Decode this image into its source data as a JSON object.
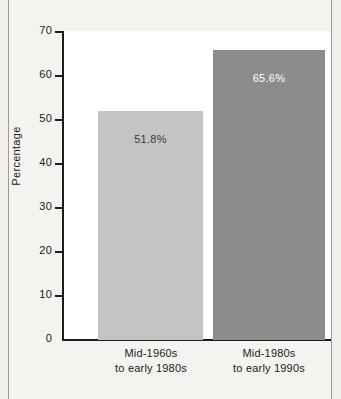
{
  "chart_data": {
    "type": "bar",
    "title": "",
    "subtitle": "",
    "xlabel": "",
    "ylabel": "Percentage",
    "categories": [
      "Mid-1960s to early 1980s",
      "Mid-1980s to early 1990s"
    ],
    "category_lines": [
      [
        "Mid-1960s",
        "to early 1980s"
      ],
      [
        "Mid-1980s",
        "to early 1990s"
      ]
    ],
    "values": [
      51.8,
      65.6
    ],
    "data_labels": [
      "51.8%",
      "65.6%"
    ],
    "ylim": [
      0,
      70
    ],
    "ytick_values": [
      0,
      10,
      20,
      30,
      40,
      50,
      60,
      70
    ],
    "ytick_labels": [
      "0",
      "10",
      "20",
      "30",
      "40",
      "50",
      "60",
      "70"
    ],
    "grid": false,
    "legend": "none",
    "bar_colors": [
      "#c4c4c4",
      "#8c8c8c"
    ],
    "label_colors": [
      "#3a3a3a",
      "#ffffff"
    ],
    "axis_color": "#1d1d1d",
    "plot_background": "#ffffff",
    "figure_background": "#f1f0ec"
  }
}
